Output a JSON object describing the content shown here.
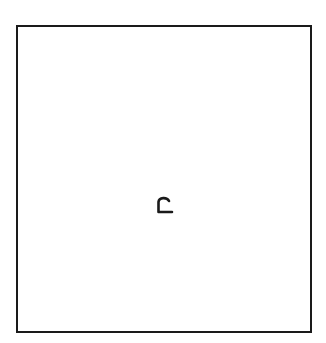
{
  "diagram": {
    "shape": "square",
    "label": "c",
    "stroke_color": "#1a1a1a",
    "background_color": "#ffffff"
  }
}
